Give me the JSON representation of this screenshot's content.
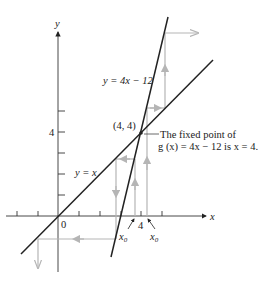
{
  "figure": {
    "axis_labels": {
      "x": "x",
      "y": "y"
    },
    "origin_label": "0",
    "x_tick_label": "4",
    "y_tick_label": "4",
    "fixed_point_label": "(4, 4)",
    "line_labels": {
      "identity": "y = x",
      "function": "y = 4x − 12"
    },
    "annotation": {
      "line1": "The fixed point of",
      "line2": "g (x) = 4x − 12 is x = 4."
    },
    "start_point_labels": [
      "x0",
      "x0"
    ],
    "start_points": [
      3.6,
      4.2
    ],
    "fixed_point": [
      4,
      4
    ],
    "colors": {
      "curves": "#222222",
      "cobweb": "#b5b5b5",
      "axes": "#333333"
    }
  }
}
